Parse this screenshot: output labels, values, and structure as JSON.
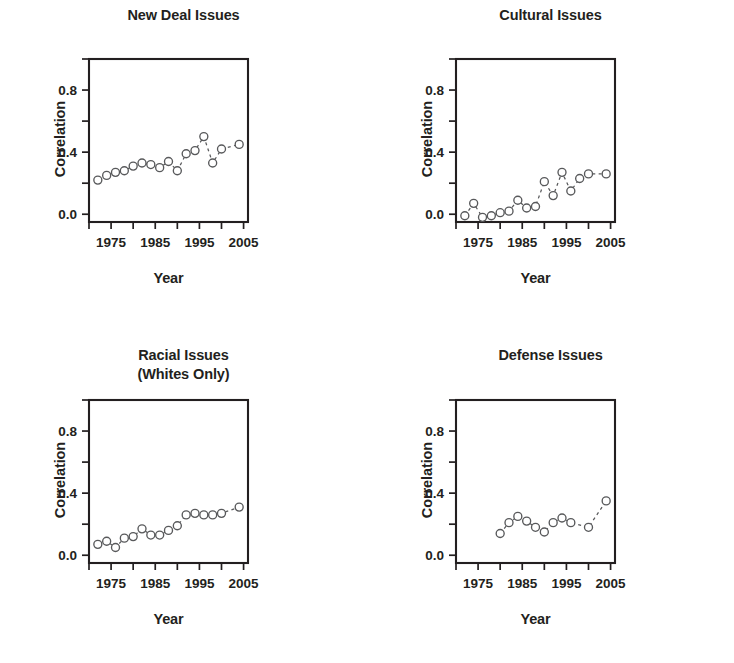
{
  "figure": {
    "panel_count": 4,
    "background": "#ffffff",
    "marker_color": "#58595b",
    "axis_color": "#231f20"
  },
  "chart_data": [
    {
      "type": "scatter",
      "title": "New Deal Issues",
      "title_lines": [
        "New Deal Issues"
      ],
      "xlabel": "Year",
      "ylabel": "Correlation",
      "xlim": [
        1970,
        2006
      ],
      "ylim": [
        -0.05,
        1.0
      ],
      "grid": false,
      "legend": "none",
      "xticks": [
        1970,
        1975,
        1980,
        1985,
        1990,
        1995,
        2000,
        2005
      ],
      "xtick_labels": [
        "",
        "1975",
        "",
        "1985",
        "",
        "1995",
        "",
        "2005"
      ],
      "yticks": [
        0.0,
        0.2,
        0.4,
        0.6,
        0.8,
        1.0
      ],
      "ytick_labels": [
        "0.0",
        "",
        "0.4",
        "",
        "0.8",
        ""
      ],
      "x": [
        1972,
        1974,
        1976,
        1978,
        1980,
        1982,
        1984,
        1986,
        1988,
        1990,
        1992,
        1994,
        1996,
        1998,
        2000,
        2004
      ],
      "y": [
        0.22,
        0.25,
        0.27,
        0.28,
        0.31,
        0.33,
        0.32,
        0.3,
        0.34,
        0.28,
        0.39,
        0.41,
        0.5,
        0.33,
        0.42,
        0.45
      ]
    },
    {
      "type": "scatter",
      "title": "Cultural Issues",
      "title_lines": [
        "Cultural Issues"
      ],
      "xlabel": "Year",
      "ylabel": "Correlation",
      "xlim": [
        1970,
        2006
      ],
      "ylim": [
        -0.05,
        1.0
      ],
      "grid": false,
      "legend": "none",
      "xticks": [
        1970,
        1975,
        1980,
        1985,
        1990,
        1995,
        2000,
        2005
      ],
      "xtick_labels": [
        "",
        "1975",
        "",
        "1985",
        "",
        "1995",
        "",
        "2005"
      ],
      "yticks": [
        0.0,
        0.2,
        0.4,
        0.6,
        0.8,
        1.0
      ],
      "ytick_labels": [
        "0.0",
        "",
        "0.4",
        "",
        "0.8",
        ""
      ],
      "x": [
        1972,
        1974,
        1976,
        1978,
        1980,
        1982,
        1984,
        1986,
        1988,
        1990,
        1992,
        1994,
        1996,
        1998,
        2000,
        2004
      ],
      "y": [
        -0.01,
        0.07,
        -0.02,
        -0.01,
        0.01,
        0.02,
        0.09,
        0.04,
        0.05,
        0.21,
        0.12,
        0.27,
        0.15,
        0.23,
        0.26,
        0.26
      ]
    },
    {
      "type": "scatter",
      "title": "Racial Issues (Whites Only)",
      "title_lines": [
        "Racial Issues",
        "(Whites Only)"
      ],
      "xlabel": "Year",
      "ylabel": "Correlation",
      "xlim": [
        1970,
        2006
      ],
      "ylim": [
        -0.05,
        1.0
      ],
      "grid": false,
      "legend": "none",
      "xticks": [
        1970,
        1975,
        1980,
        1985,
        1990,
        1995,
        2000,
        2005
      ],
      "xtick_labels": [
        "",
        "1975",
        "",
        "1985",
        "",
        "1995",
        "",
        "2005"
      ],
      "yticks": [
        0.0,
        0.2,
        0.4,
        0.6,
        0.8,
        1.0
      ],
      "ytick_labels": [
        "0.0",
        "",
        "0.4",
        "",
        "0.8",
        ""
      ],
      "x": [
        1972,
        1974,
        1976,
        1978,
        1980,
        1982,
        1984,
        1986,
        1988,
        1990,
        1992,
        1994,
        1996,
        1998,
        2000,
        2004
      ],
      "y": [
        0.07,
        0.09,
        0.05,
        0.11,
        0.12,
        0.17,
        0.13,
        0.13,
        0.16,
        0.19,
        0.26,
        0.27,
        0.26,
        0.26,
        0.27,
        0.31
      ]
    },
    {
      "type": "scatter",
      "title": "Defense Issues",
      "title_lines": [
        "Defense Issues"
      ],
      "xlabel": "Year",
      "ylabel": "Correlation",
      "xlim": [
        1970,
        2006
      ],
      "ylim": [
        -0.05,
        1.0
      ],
      "grid": false,
      "legend": "none",
      "xticks": [
        1970,
        1975,
        1980,
        1985,
        1990,
        1995,
        2000,
        2005
      ],
      "xtick_labels": [
        "",
        "1975",
        "",
        "1985",
        "",
        "1995",
        "",
        "2005"
      ],
      "yticks": [
        0.0,
        0.2,
        0.4,
        0.6,
        0.8,
        1.0
      ],
      "ytick_labels": [
        "0.0",
        "",
        "0.4",
        "",
        "0.8",
        ""
      ],
      "x": [
        1980,
        1982,
        1984,
        1986,
        1988,
        1990,
        1992,
        1994,
        1996,
        2000,
        2004
      ],
      "y": [
        0.14,
        0.21,
        0.25,
        0.22,
        0.18,
        0.15,
        0.21,
        0.24,
        0.21,
        0.18,
        0.35
      ]
    }
  ]
}
